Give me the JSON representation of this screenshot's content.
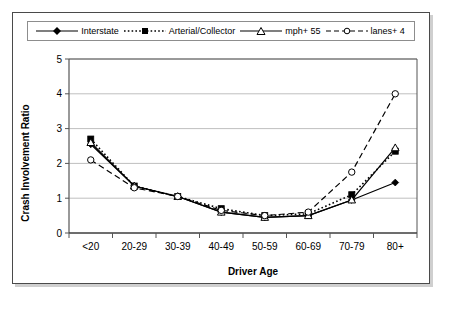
{
  "chart_data": {
    "type": "line",
    "title": "",
    "xlabel": "Driver Age",
    "ylabel": "Crash Involvement Ratio",
    "categories": [
      "<20",
      "20-29",
      "30-39",
      "40-49",
      "50-59",
      "60-69",
      "70-79",
      "80+"
    ],
    "ylim": [
      0,
      5
    ],
    "yticks": [
      0,
      1,
      2,
      3,
      4,
      5
    ],
    "grid": "horizontal",
    "legend_position": "top",
    "series": [
      {
        "name": "Interstate",
        "marker": "filled-diamond",
        "line": "solid",
        "values": [
          2.55,
          1.35,
          1.05,
          0.6,
          0.45,
          0.5,
          0.95,
          1.45
        ]
      },
      {
        "name": "Arterial/Collector",
        "marker": "filled-square",
        "line": "dotted",
        "values": [
          2.7,
          1.35,
          1.05,
          0.7,
          0.5,
          0.55,
          1.1,
          2.35
        ]
      },
      {
        "name": "mph+ 55",
        "marker": "open-triangle",
        "line": "solid",
        "values": [
          2.6,
          1.35,
          1.05,
          0.6,
          0.45,
          0.5,
          0.95,
          2.45
        ]
      },
      {
        "name": "lanes+ 4",
        "marker": "open-circle",
        "line": "dashed",
        "values": [
          2.1,
          1.3,
          1.05,
          0.65,
          0.5,
          0.6,
          1.75,
          4.0
        ]
      }
    ]
  },
  "legend": {
    "items": [
      {
        "label": "Interstate"
      },
      {
        "label": "Arterial/Collector"
      },
      {
        "label": "mph+ 55"
      },
      {
        "label": "lanes+ 4"
      }
    ]
  },
  "axes": {
    "y_title": "Crash Involvement Ratio",
    "x_title": "Driver Age",
    "y_ticks": [
      "0",
      "1",
      "2",
      "3",
      "4",
      "5"
    ],
    "x_ticks": [
      "<20",
      "20-29",
      "30-39",
      "40-49",
      "50-59",
      "60-69",
      "70-79",
      "80+"
    ]
  },
  "colors": {
    "line": "#000000",
    "grid": "#bfbfbf",
    "axis": "#555555",
    "frame": "#4a4a4a",
    "background": "#ffffff"
  }
}
